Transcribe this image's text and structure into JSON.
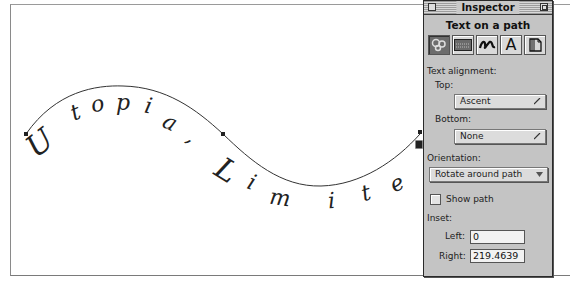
{
  "canvas": {
    "path_text": "Utopia, Limite",
    "glyphs": [
      {
        "ch": "U",
        "x": 45,
        "y": 150,
        "rot": -38,
        "size": 30
      },
      {
        "ch": "t",
        "x": 77,
        "y": 118,
        "rot": -22,
        "size": 22
      },
      {
        "ch": "o",
        "x": 98,
        "y": 110,
        "rot": -12,
        "size": 22
      },
      {
        "ch": "p",
        "x": 122,
        "y": 109,
        "rot": 0,
        "size": 22
      },
      {
        "ch": "i",
        "x": 146,
        "y": 112,
        "rot": 12,
        "size": 22
      },
      {
        "ch": "a",
        "x": 166,
        "y": 128,
        "rot": 26,
        "size": 22
      },
      {
        "ch": ",",
        "x": 187,
        "y": 141,
        "rot": 35,
        "size": 22
      },
      {
        "ch": "L",
        "x": 220,
        "y": 178,
        "rot": 32,
        "size": 30
      },
      {
        "ch": "i",
        "x": 248,
        "y": 188,
        "rot": 22,
        "size": 22
      },
      {
        "ch": "m",
        "x": 278,
        "y": 204,
        "rot": 8,
        "size": 22
      },
      {
        "ch": "i",
        "x": 331,
        "y": 207,
        "rot": -4,
        "size": 22
      },
      {
        "ch": "t",
        "x": 367,
        "y": 199,
        "rot": -16,
        "size": 22
      },
      {
        "ch": "e",
        "x": 399,
        "y": 189,
        "rot": -26,
        "size": 22
      }
    ],
    "path_color": "#333333"
  },
  "inspector": {
    "title": "Inspector",
    "heading": "Text on a path",
    "tool_icons": [
      {
        "name": "text-on-path-icon",
        "selected": true
      },
      {
        "name": "fill-pattern-icon",
        "selected": false
      },
      {
        "name": "stroke-squiggle-icon",
        "selected": false
      },
      {
        "name": "character-A-icon",
        "selected": false
      },
      {
        "name": "paragraph-page-icon",
        "selected": false
      }
    ],
    "text_alignment_label": "Text alignment:",
    "top_label": "Top:",
    "top_value": "Ascent",
    "bottom_label": "Bottom:",
    "bottom_value": "None",
    "orientation_label": "Orientation:",
    "orientation_value": "Rotate around path",
    "show_path_label": "Show path",
    "show_path_checked": false,
    "inset_label": "Inset:",
    "left_label": "Left:",
    "left_value": "0",
    "right_label": "Right:",
    "right_value": "219.4639"
  }
}
